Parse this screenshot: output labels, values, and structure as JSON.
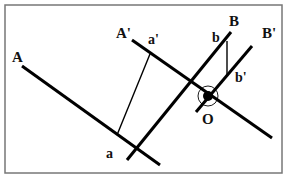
{
  "diagram": {
    "type": "geometric-construction",
    "frame": {
      "x": 5,
      "y": 5,
      "width": 277,
      "height": 168,
      "color": "#777777"
    },
    "stroke_color": "#000000",
    "lines": [
      {
        "id": "A",
        "label": "A",
        "x1": 22,
        "y1": 66,
        "x2": 160,
        "y2": 165,
        "weight": "thick"
      },
      {
        "id": "A'",
        "label": "A'",
        "x1": 132,
        "y1": 40,
        "x2": 272,
        "y2": 138,
        "weight": "thick"
      },
      {
        "id": "B",
        "label": "B",
        "x1": 231,
        "y1": 32,
        "x2": 127,
        "y2": 160,
        "weight": "thick"
      },
      {
        "id": "B'",
        "label": "B'",
        "x1": 252,
        "y1": 46,
        "x2": 196,
        "y2": 112,
        "weight": "thick"
      },
      {
        "id": "aa'",
        "label": "a–a'",
        "x1": 117,
        "y1": 135,
        "x2": 150,
        "y2": 54,
        "weight": "thin"
      },
      {
        "id": "bb'",
        "label": "b–b'",
        "x1": 227,
        "y1": 41,
        "x2": 227,
        "y2": 76,
        "weight": "thin"
      }
    ],
    "point_O": {
      "label": "O",
      "cx": 208,
      "cy": 96,
      "dot_r": 5,
      "ring_r": 10
    },
    "labels": [
      {
        "text": "A",
        "x": 12,
        "y": 62
      },
      {
        "text": "A'",
        "x": 116,
        "y": 38
      },
      {
        "text": "a'",
        "x": 148,
        "y": 44
      },
      {
        "text": "B",
        "x": 229,
        "y": 26
      },
      {
        "text": "b",
        "x": 212,
        "y": 42
      },
      {
        "text": "B'",
        "x": 262,
        "y": 38
      },
      {
        "text": "b'",
        "x": 235,
        "y": 82
      },
      {
        "text": "O",
        "x": 202,
        "y": 124
      },
      {
        "text": "a",
        "x": 106,
        "y": 158
      }
    ]
  }
}
